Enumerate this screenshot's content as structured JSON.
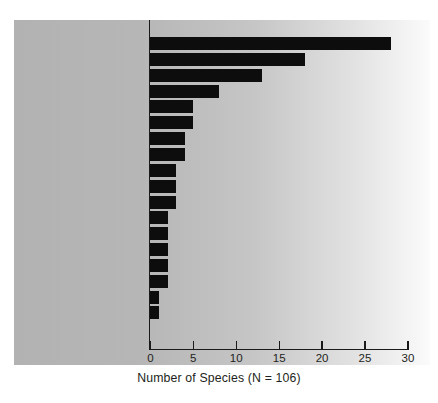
{
  "chart_data": {
    "type": "bar",
    "orientation": "horizontal",
    "title": "",
    "xlabel": "Number of Species (N = 106)",
    "ylabel": "",
    "xlim": [
      0,
      30
    ],
    "xticks": [
      0,
      5,
      10,
      15,
      20,
      25,
      30
    ],
    "xtick_labels": [
      "0",
      "5",
      "10",
      "15",
      "20",
      "25",
      "30"
    ],
    "grid": false,
    "legend": null,
    "total_species": 106,
    "bar_color": "#0d0d0d",
    "background_colors": {
      "panel_left": "#b2b2b2",
      "panel_right": "#fbfbfb",
      "figure": "#ffffff",
      "text": "#231f20",
      "axis": "#1a1a1a"
    },
    "categories": [
      "Mammals",
      "Sauropods",
      "Theropods",
      "Crocodylomorphs",
      "Ray-finned Fish",
      "Lizards",
      "Pterosaurs",
      "Turtles",
      "Stegosaurs",
      "Ornithopods",
      "Sphenodontians",
      "Frogs",
      "Salamanders",
      "Basal Neornithischians",
      "Lungfish",
      "Ankylosaurs",
      "Heterodontosaurids",
      "Choristoderes"
    ],
    "values": [
      28,
      18,
      13,
      8,
      5,
      5,
      4,
      4,
      3,
      3,
      3,
      2,
      2,
      2,
      2,
      2,
      1,
      1
    ]
  }
}
